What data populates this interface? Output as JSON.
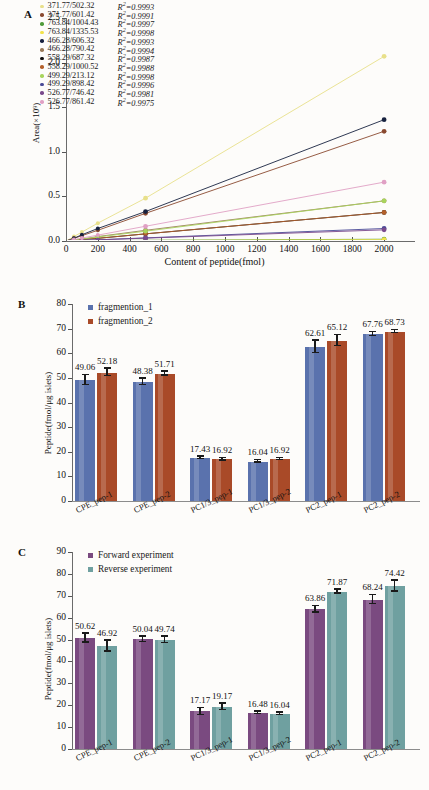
{
  "figure": {
    "panels": [
      "A",
      "B",
      "C"
    ]
  },
  "panelA": {
    "letter": "A",
    "ylabel": "Area(×10⁹)",
    "xlabel": "Content of peptide(fmol)",
    "yticks": [
      "0.0",
      "0.5",
      "1.0",
      "1.5",
      "2.0",
      "2.5"
    ],
    "xticks": [
      "0",
      "200",
      "400",
      "600",
      "800",
      "1000",
      "1200",
      "1400",
      "1600",
      "1800",
      "2000"
    ],
    "legend": [
      {
        "label": "371.77/502.32",
        "r2": "R²=0.9993",
        "color": "#e8e08a"
      },
      {
        "label": "371.77/601.42",
        "r2": "R²=0.9991",
        "color": "#8a4a30"
      },
      {
        "label": "763.84/1004.43",
        "r2": "R²=0.9997",
        "color": "#4f9b3a"
      },
      {
        "label": "763.84/1335.53",
        "r2": "R²=0.9998",
        "color": "#f2e34a"
      },
      {
        "label": "466.28/606.32",
        "r2": "R²=0.9993",
        "color": "#17223f"
      },
      {
        "label": "466.28/790.42",
        "r2": "R²=0.9994",
        "color": "#9a7a58"
      },
      {
        "label": "558.29/687.32",
        "r2": "R²=0.9987",
        "color": "#12100e"
      },
      {
        "label": "558.29/1000.52",
        "r2": "R²=0.9988",
        "color": "#b4602a"
      },
      {
        "label": "499.29/213.12",
        "r2": "R²=0.9998",
        "color": "#a8d45c"
      },
      {
        "label": "499.29/898.42",
        "r2": "R²=0.9996",
        "color": "#4a4a96"
      },
      {
        "label": "526.77/746.42",
        "r2": "R²=0.9981",
        "color": "#7a4a8c"
      },
      {
        "label": "526.77/861.42",
        "r2": "R²=0.9975",
        "color": "#e0a0c4"
      }
    ]
  },
  "panelB": {
    "letter": "B",
    "ylabel": "Peptide(fmol/μg islets)",
    "yticks": [
      "0",
      "10",
      "20",
      "30",
      "40",
      "50",
      "60",
      "70",
      "80"
    ],
    "legend": [
      {
        "label": "fragmention_1",
        "color": "#5a72ad"
      },
      {
        "label": "fragmention_2",
        "color": "#a94a28"
      }
    ]
  },
  "panelC": {
    "letter": "C",
    "ylabel": "Peptide(fmol/μg islets)",
    "yticks": [
      "0",
      "10",
      "20",
      "30",
      "40",
      "50",
      "60",
      "70",
      "80",
      "90"
    ],
    "legend": [
      {
        "label": "Forward experiment",
        "color": "#7a4a80"
      },
      {
        "label": "Reverse experiment",
        "color": "#6fa0a0"
      }
    ]
  },
  "chart_data": [
    {
      "panel": "A",
      "type": "line",
      "title": "",
      "xlabel": "Content of peptide(fmol)",
      "ylabel": "Area(×10⁹)",
      "xlim": [
        0,
        2100
      ],
      "ylim": [
        0.0,
        2.5
      ],
      "grid": false,
      "legend_position": "upper-left-inside",
      "x": [
        0,
        50,
        100,
        200,
        500,
        2000
      ],
      "series": [
        {
          "name": "371.77/502.32",
          "r2": 0.9993,
          "color": "#e8e08a",
          "values": [
            0,
            0.05,
            0.1,
            0.2,
            0.48,
            2.07
          ]
        },
        {
          "name": "371.77/601.42",
          "r2": 0.9991,
          "color": "#8a4a30",
          "values": [
            0,
            0.03,
            0.06,
            0.12,
            0.31,
            1.23
          ]
        },
        {
          "name": "763.84/1004.43",
          "r2": 0.9997,
          "color": "#4f9b3a",
          "values": [
            0,
            0.001,
            0.002,
            0.004,
            0.008,
            0.02
          ]
        },
        {
          "name": "763.84/1335.53",
          "r2": 0.9998,
          "color": "#f2e34a",
          "values": [
            0,
            0.001,
            0.002,
            0.003,
            0.006,
            0.015
          ]
        },
        {
          "name": "466.28/606.32",
          "r2": 0.9993,
          "color": "#17223f",
          "values": [
            0,
            0.03,
            0.07,
            0.14,
            0.33,
            1.36
          ]
        },
        {
          "name": "466.28/790.42",
          "r2": 0.9994,
          "color": "#9a7a58",
          "values": [
            0,
            0.01,
            0.02,
            0.05,
            0.12,
            0.45
          ]
        },
        {
          "name": "558.29/687.32",
          "r2": 0.9987,
          "color": "#12100e",
          "values": [
            0,
            0.008,
            0.016,
            0.03,
            0.08,
            0.32
          ]
        },
        {
          "name": "558.29/1000.52",
          "r2": 0.9988,
          "color": "#b4602a",
          "values": [
            0,
            0.008,
            0.016,
            0.03,
            0.08,
            0.32
          ]
        },
        {
          "name": "499.29/213.12",
          "r2": 0.9998,
          "color": "#a8d45c",
          "values": [
            0,
            0.011,
            0.022,
            0.045,
            0.11,
            0.45
          ]
        },
        {
          "name": "499.29/898.42",
          "r2": 0.9996,
          "color": "#4a4a96",
          "values": [
            0,
            0.003,
            0.007,
            0.014,
            0.035,
            0.14
          ]
        },
        {
          "name": "526.77/746.42",
          "r2": 0.9981,
          "color": "#7a4a8c",
          "values": [
            0,
            0.003,
            0.006,
            0.012,
            0.032,
            0.125
          ]
        },
        {
          "name": "526.77/861.42",
          "r2": 0.9975,
          "color": "#e0a0c4",
          "values": [
            0,
            0.016,
            0.033,
            0.066,
            0.165,
            0.66
          ]
        }
      ]
    },
    {
      "panel": "B",
      "type": "bar",
      "title": "",
      "xlabel": "",
      "ylabel": "Peptide(fmol/μg islets)",
      "ylim": [
        0,
        80
      ],
      "grid": false,
      "legend_position": "upper-left-inside",
      "categories": [
        "CPE_pep-1",
        "CPE_pep-2",
        "PC1/3_pep-1",
        "PC1/3_pep-2",
        "PC2_pep-1",
        "PC2_pep-2"
      ],
      "series": [
        {
          "name": "fragmention_1",
          "color": "#5a72ad",
          "values": [
            49.06,
            48.38,
            17.43,
            16.04,
            62.61,
            67.76
          ],
          "errors": [
            2.0,
            1.3,
            0.5,
            0.5,
            2.5,
            0.8
          ]
        },
        {
          "name": "fragmention_2",
          "color": "#a94a28",
          "values": [
            52.18,
            51.71,
            16.92,
            16.92,
            65.12,
            68.73
          ],
          "errors": [
            1.5,
            0.8,
            0.5,
            0.4,
            2.2,
            0.7
          ]
        }
      ]
    },
    {
      "panel": "C",
      "type": "bar",
      "title": "",
      "xlabel": "",
      "ylabel": "Peptide(fmol/μg islets)",
      "ylim": [
        0,
        90
      ],
      "grid": false,
      "legend_position": "upper-left-inside",
      "categories": [
        "CPE_pep-1",
        "CPE_pep-2",
        "PC1/3_pep-1",
        "PC1/3_pep-2",
        "PC2_pep-1",
        "PC2_pep-2"
      ],
      "series": [
        {
          "name": "Forward experiment",
          "color": "#7a4a80",
          "values": [
            50.62,
            50.04,
            17.17,
            16.48,
            63.86,
            68.24
          ],
          "errors": [
            2.0,
            1.2,
            1.6,
            0.6,
            1.5,
            2.0
          ]
        },
        {
          "name": "Reverse experiment",
          "color": "#6fa0a0",
          "values": [
            46.92,
            49.74,
            19.17,
            16.04,
            71.87,
            74.42
          ],
          "errors": [
            2.5,
            1.5,
            1.5,
            0.5,
            1.0,
            2.5
          ]
        }
      ]
    }
  ]
}
